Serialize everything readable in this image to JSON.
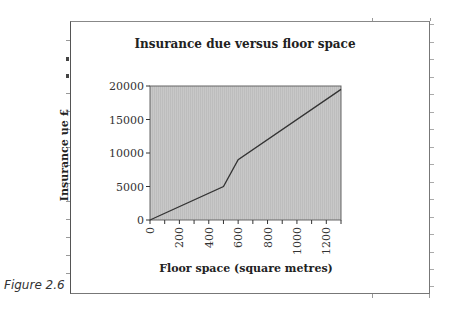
{
  "figure": {
    "caption": "Figure 2.6"
  },
  "chart_data": {
    "type": "area",
    "title": "Insurance due versus floor space",
    "xlabel": "Floor space (square metres)",
    "ylabel": "Insurance ue £",
    "x": [
      0,
      500,
      600,
      1300
    ],
    "series": [
      {
        "name": "Insurance due",
        "values": [
          0,
          5000,
          9000,
          19500
        ]
      }
    ],
    "xlim": [
      0,
      1300
    ],
    "ylim": [
      0,
      20000
    ],
    "xticks": [
      0,
      200,
      400,
      600,
      800,
      1000,
      1200
    ],
    "yticks": [
      0,
      5000,
      10000,
      15000,
      20000
    ],
    "x_minor_step": 100,
    "grid": false,
    "legend": "none",
    "plot_fill": "#c8c8c8",
    "line_color": "#333333"
  }
}
